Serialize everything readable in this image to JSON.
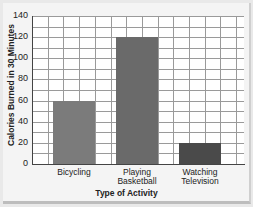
{
  "chart_data": {
    "type": "bar",
    "title": "",
    "categories": [
      "Bicycling",
      "Playing Basketball",
      "Watching Television"
    ],
    "category_lines": [
      [
        "Bicycling"
      ],
      [
        "Playing",
        "Basketball"
      ],
      [
        "Watching",
        "Television"
      ]
    ],
    "values": [
      60,
      120,
      20
    ],
    "colors": [
      "#7b7b7b",
      "#6a6a6a",
      "#4a4a4a"
    ],
    "xlabel": "Type of Activity",
    "ylabel": "Calories Burned in 30 Minutes",
    "ylim": [
      0,
      140
    ],
    "yticks": [
      0,
      20,
      40,
      60,
      80,
      100,
      120,
      140
    ],
    "grid": true,
    "minor_grid_step": 10,
    "legend": null
  }
}
